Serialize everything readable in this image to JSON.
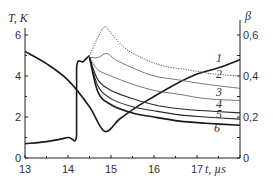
{
  "chart_data": {
    "type": "line",
    "title": "",
    "xlabel": "t, µs",
    "ylabel_left": "T, K",
    "ylabel_right": "β",
    "xlim": [
      13,
      18
    ],
    "ylim_left": [
      0,
      6.6
    ],
    "ylim_right": [
      0,
      0.66
    ],
    "x_ticks": [
      "13",
      "14",
      "15",
      "16",
      "17"
    ],
    "y_ticks_left": [
      "0",
      "2",
      "4",
      "6"
    ],
    "y_ticks_right": [
      "0",
      "0,2",
      "0,4",
      "0,6"
    ],
    "grid": false,
    "legend": "inline curve numbers 1-6 at right",
    "series": [
      {
        "name": "β (thick)",
        "axis": "right",
        "style": "solid-thick",
        "x": [
          13.0,
          13.5,
          14.0,
          14.5,
          14.85,
          15.2,
          15.6,
          16.0,
          16.5,
          17.0,
          17.5,
          18.0
        ],
        "y": [
          0.52,
          0.46,
          0.38,
          0.25,
          0.13,
          0.19,
          0.25,
          0.3,
          0.36,
          0.41,
          0.44,
          0.48
        ]
      },
      {
        "name": "T before transition (thick)",
        "axis": "left",
        "style": "solid-thick",
        "x": [
          13.0,
          13.5,
          14.0,
          14.2,
          14.2,
          14.35,
          14.5
        ],
        "y": [
          0.7,
          0.8,
          1.0,
          1.1,
          4.4,
          4.7,
          5.0
        ]
      },
      {
        "name": "1",
        "axis": "left",
        "style": "dotted",
        "x": [
          14.5,
          14.7,
          14.85,
          15.0,
          15.3,
          15.7,
          16.2,
          16.8,
          17.4,
          18.0
        ],
        "y": [
          5.0,
          5.9,
          6.4,
          6.1,
          5.4,
          4.9,
          4.5,
          4.3,
          4.1,
          4.0
        ]
      },
      {
        "name": "2",
        "axis": "left",
        "style": "solid-thin",
        "x": [
          14.5,
          14.7,
          14.9,
          15.1,
          15.5,
          16.0,
          16.6,
          17.2,
          18.0
        ],
        "y": [
          4.9,
          4.9,
          5.1,
          4.8,
          4.4,
          4.0,
          3.8,
          3.6,
          3.4
        ]
      },
      {
        "name": "3",
        "axis": "left",
        "style": "solid-thin",
        "x": [
          14.5,
          14.7,
          15.0,
          15.5,
          16.0,
          16.6,
          17.2,
          18.0
        ],
        "y": [
          4.9,
          4.3,
          4.0,
          3.6,
          3.3,
          3.1,
          2.9,
          2.8
        ]
      },
      {
        "name": "4",
        "axis": "left",
        "style": "solid",
        "x": [
          14.5,
          14.7,
          15.0,
          15.5,
          16.0,
          16.6,
          17.2,
          18.0
        ],
        "y": [
          4.9,
          3.8,
          3.3,
          2.9,
          2.6,
          2.4,
          2.3,
          2.2
        ]
      },
      {
        "name": "5",
        "axis": "left",
        "style": "solid",
        "x": [
          14.5,
          14.7,
          15.0,
          15.5,
          16.0,
          16.6,
          17.2,
          18.0
        ],
        "y": [
          4.9,
          3.5,
          2.9,
          2.5,
          2.3,
          2.1,
          2.0,
          1.9
        ]
      },
      {
        "name": "6",
        "axis": "left",
        "style": "solid-thick",
        "x": [
          14.5,
          14.7,
          15.0,
          15.5,
          16.0,
          16.6,
          17.2,
          18.0
        ],
        "y": [
          4.9,
          3.2,
          2.6,
          2.2,
          2.0,
          1.8,
          1.7,
          1.6
        ]
      }
    ]
  },
  "labels": {
    "y_left": "T, K",
    "y_right": "β",
    "x": "t, µs",
    "curves": [
      "1",
      "2",
      "3",
      "4",
      "5",
      "6"
    ]
  }
}
